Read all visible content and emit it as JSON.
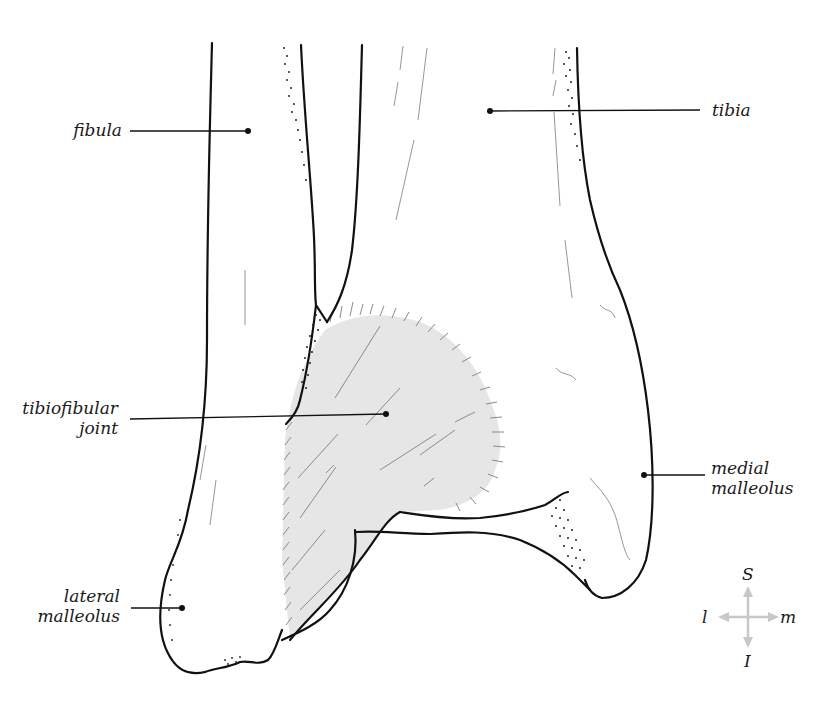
{
  "figure": {
    "type": "anatomical-illustration",
    "colors": {
      "outline": "#111111",
      "joint_fill": "#e6e6e6",
      "hatch": "#8a8a8a",
      "compass_arrows": "#c8c8c8",
      "text": "#1a1a1a",
      "background": "#ffffff"
    }
  },
  "labels": {
    "fibula": "fibula",
    "tibia": "tibia",
    "tibiofibular_line1": "tibiofibular",
    "tibiofibular_line2": "joint",
    "medial_line1": "medial",
    "medial_line2": "malleolus",
    "lateral_line1": "lateral",
    "lateral_line2": "malleolus"
  },
  "compass": {
    "superior": "S",
    "inferior": "I",
    "lateral": "l",
    "medial": "m"
  }
}
